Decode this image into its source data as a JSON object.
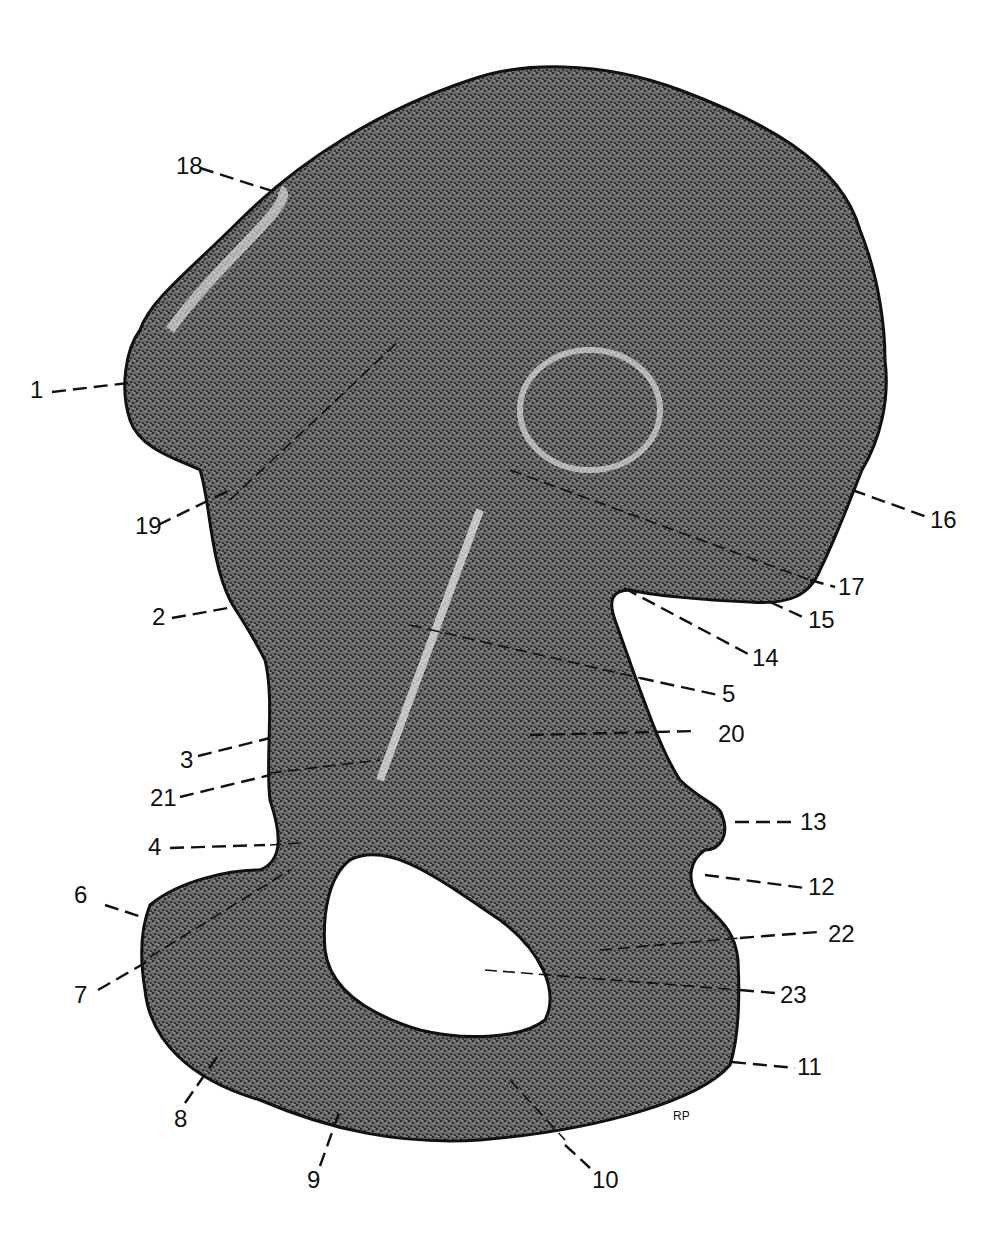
{
  "figure": {
    "signature": "RP",
    "colors": {
      "ink": "#111111",
      "paper": "#ffffff"
    }
  },
  "labels": [
    {
      "id": "1",
      "text": "1",
      "x": 30,
      "y": 398
    },
    {
      "id": "2",
      "text": "2",
      "x": 152,
      "y": 622
    },
    {
      "id": "3",
      "text": "3",
      "x": 180,
      "y": 768
    },
    {
      "id": "4",
      "text": "4",
      "x": 148,
      "y": 852
    },
    {
      "id": "5",
      "text": "5",
      "x": 722,
      "y": 722
    },
    {
      "id": "6",
      "text": "6",
      "x": 74,
      "y": 903
    },
    {
      "id": "7",
      "text": "7",
      "x": 74,
      "y": 1003
    },
    {
      "id": "8",
      "text": "8",
      "x": 174,
      "y": 1127
    },
    {
      "id": "9",
      "text": "9",
      "x": 307,
      "y": 1188
    },
    {
      "id": "10",
      "text": "10",
      "x": 592,
      "y": 1188
    },
    {
      "id": "11",
      "text": "11",
      "x": 795,
      "y": 1069
    },
    {
      "id": "12",
      "text": "12",
      "x": 808,
      "y": 895
    },
    {
      "id": "13",
      "text": "13",
      "x": 800,
      "y": 829
    },
    {
      "id": "14",
      "text": "14",
      "x": 752,
      "y": 664
    },
    {
      "id": "15",
      "text": "15",
      "x": 808,
      "y": 626
    },
    {
      "id": "16",
      "text": "16",
      "x": 930,
      "y": 527
    },
    {
      "id": "17",
      "text": "17",
      "x": 838,
      "y": 593
    },
    {
      "id": "18",
      "text": "18",
      "x": 176,
      "y": 173
    },
    {
      "id": "19",
      "text": "19",
      "x": 135,
      "y": 532
    },
    {
      "id": "20",
      "text": "20",
      "x": 718,
      "y": 742
    },
    {
      "id": "21",
      "text": "21",
      "x": 150,
      "y": 805
    },
    {
      "id": "22",
      "text": "22",
      "x": 830,
      "y": 941
    },
    {
      "id": "23",
      "text": "23",
      "x": 780,
      "y": 1003
    }
  ]
}
